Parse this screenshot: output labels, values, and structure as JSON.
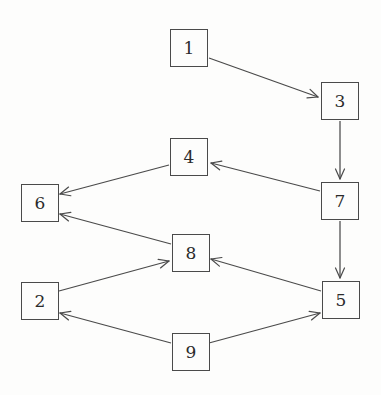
{
  "diagram": {
    "type": "directed-graph",
    "width": 381,
    "height": 395,
    "background_color": "#fdfdfc",
    "node_stroke_color": "#4a4a4a",
    "edge_stroke_color": "#4a4a4a",
    "label_color": "#2b2b2b",
    "node_size": 38,
    "nodes": [
      {
        "id": "1",
        "label": "1",
        "x": 170,
        "y": 29
      },
      {
        "id": "3",
        "label": "3",
        "x": 321,
        "y": 82
      },
      {
        "id": "4",
        "label": "4",
        "x": 170,
        "y": 138
      },
      {
        "id": "7",
        "label": "7",
        "x": 321,
        "y": 182
      },
      {
        "id": "6",
        "label": "6",
        "x": 21,
        "y": 184
      },
      {
        "id": "8",
        "label": "8",
        "x": 172,
        "y": 234
      },
      {
        "id": "2",
        "label": "2",
        "x": 21,
        "y": 282
      },
      {
        "id": "5",
        "label": "5",
        "x": 322,
        "y": 281
      },
      {
        "id": "9",
        "label": "9",
        "x": 172,
        "y": 333
      }
    ],
    "edges": [
      {
        "from": "1",
        "to": "3",
        "x1": 209,
        "y1": 58,
        "x2": 318,
        "y2": 97,
        "arrow": true
      },
      {
        "from": "3",
        "to": "7",
        "x1": 340,
        "y1": 121,
        "x2": 340,
        "y2": 179,
        "arrow": true
      },
      {
        "from": "7",
        "to": "5",
        "x1": 340,
        "y1": 221,
        "x2": 340,
        "y2": 278,
        "arrow": true
      },
      {
        "from": "7",
        "to": "4",
        "x1": 320,
        "y1": 191,
        "x2": 211,
        "y2": 163,
        "arrow": true
      },
      {
        "from": "4",
        "to": "6",
        "x1": 169,
        "y1": 165,
        "x2": 60,
        "y2": 194,
        "arrow": true
      },
      {
        "from": "8",
        "to": "6",
        "x1": 171,
        "y1": 244,
        "x2": 60,
        "y2": 214,
        "arrow": true
      },
      {
        "from": "2",
        "to": "8",
        "x1": 59,
        "y1": 291,
        "x2": 169,
        "y2": 261,
        "arrow": true
      },
      {
        "from": "5",
        "to": "8",
        "x1": 321,
        "y1": 291,
        "x2": 211,
        "y2": 259,
        "arrow": true
      },
      {
        "from": "9",
        "to": "2",
        "x1": 171,
        "y1": 343,
        "x2": 60,
        "y2": 313,
        "arrow": true
      },
      {
        "from": "9",
        "to": "5",
        "x1": 209,
        "y1": 343,
        "x2": 320,
        "y2": 313,
        "arrow": true
      }
    ]
  }
}
